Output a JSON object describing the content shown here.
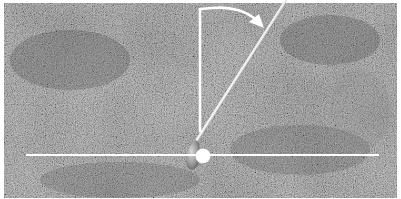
{
  "figure": {
    "colors": {
      "background": "#ffffff",
      "grass_base": "#6f6f6f",
      "grass_dark": "#4a4a4a",
      "grass_light": "#8c8c8c",
      "overlay": "#ffffff"
    },
    "elements": {
      "target_line": {
        "x1": 26,
        "y1": 155,
        "x2": 379,
        "y2": 155
      },
      "ball": {
        "cx": 203,
        "cy": 156,
        "r": 7.5
      },
      "vertical_line": {
        "x": 200,
        "y1": 8,
        "y2": 132
      },
      "rotation_arrow": {
        "from": [
          200,
          8
        ],
        "to": [
          262,
          27
        ]
      },
      "shaft": {
        "x1": 286,
        "y1": 0,
        "x2": 196,
        "y2": 143
      }
    }
  }
}
